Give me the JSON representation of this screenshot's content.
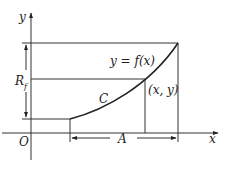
{
  "diagram": {
    "labels": {
      "y_axis": "y",
      "x_axis": "x",
      "origin": "O",
      "function": "y = f(x)",
      "curve": "C",
      "point": "(x, y)",
      "range_main": "R",
      "range_sub": "f",
      "domain_span": "A"
    },
    "colors": {
      "stroke": "#333333",
      "background": "#ffffff"
    }
  }
}
